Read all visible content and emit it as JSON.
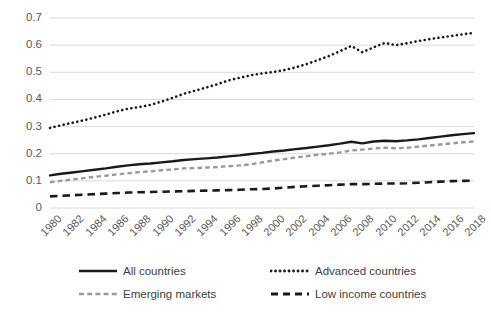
{
  "chart_data": {
    "type": "line",
    "title": "",
    "subtitle": "",
    "xlabel": "",
    "ylabel": "",
    "xlim": [
      1980,
      2018
    ],
    "ylim": [
      0,
      0.7
    ],
    "grid": true,
    "grid_axis": "y",
    "legend_position": "bottom",
    "y_ticks": [
      "0",
      "0.1",
      "0.2",
      "0.3",
      "0.4",
      "0.5",
      "0.6",
      "0.7"
    ],
    "y_tick_values": [
      0,
      0.1,
      0.2,
      0.3,
      0.4,
      0.5,
      0.6,
      0.7
    ],
    "x_tick_labels": [
      "1980",
      "1982",
      "1984",
      "1986",
      "1988",
      "1990",
      "1992",
      "1994",
      "1996",
      "1998",
      "2000",
      "2002",
      "2004",
      "2006",
      "2008",
      "2010",
      "2012",
      "2014",
      "2016",
      "2018"
    ],
    "x": [
      1980,
      1981,
      1982,
      1983,
      1984,
      1985,
      1986,
      1987,
      1988,
      1989,
      1990,
      1991,
      1992,
      1993,
      1994,
      1995,
      1996,
      1997,
      1998,
      1999,
      2000,
      2001,
      2002,
      2003,
      2004,
      2005,
      2006,
      2007,
      2008,
      2009,
      2010,
      2011,
      2012,
      2013,
      2014,
      2015,
      2016,
      2017,
      2018
    ],
    "series": [
      {
        "name": "All countries",
        "style": "solid",
        "color": "#1a1a1a",
        "width": 2.4,
        "values": [
          0.12,
          0.126,
          0.131,
          0.136,
          0.141,
          0.146,
          0.152,
          0.157,
          0.161,
          0.164,
          0.168,
          0.172,
          0.177,
          0.18,
          0.183,
          0.186,
          0.19,
          0.194,
          0.199,
          0.203,
          0.208,
          0.212,
          0.217,
          0.221,
          0.226,
          0.231,
          0.237,
          0.244,
          0.238,
          0.245,
          0.248,
          0.246,
          0.249,
          0.253,
          0.258,
          0.263,
          0.268,
          0.272,
          0.276
        ]
      },
      {
        "name": "Advanced countries",
        "style": "dotted",
        "color": "#1a1a1a",
        "width": 2.6,
        "values": [
          0.295,
          0.305,
          0.314,
          0.323,
          0.333,
          0.344,
          0.356,
          0.366,
          0.372,
          0.38,
          0.392,
          0.406,
          0.421,
          0.432,
          0.444,
          0.456,
          0.47,
          0.48,
          0.489,
          0.496,
          0.501,
          0.508,
          0.518,
          0.53,
          0.545,
          0.56,
          0.578,
          0.597,
          0.574,
          0.592,
          0.608,
          0.6,
          0.607,
          0.615,
          0.622,
          0.628,
          0.634,
          0.64,
          0.645
        ]
      },
      {
        "name": "Emerging markets",
        "style": "dashed",
        "color": "#999999",
        "width": 2.4,
        "values": [
          0.095,
          0.1,
          0.105,
          0.11,
          0.115,
          0.119,
          0.124,
          0.128,
          0.132,
          0.135,
          0.139,
          0.142,
          0.146,
          0.147,
          0.149,
          0.151,
          0.154,
          0.157,
          0.161,
          0.168,
          0.175,
          0.18,
          0.186,
          0.191,
          0.196,
          0.2,
          0.205,
          0.212,
          0.215,
          0.219,
          0.222,
          0.22,
          0.222,
          0.226,
          0.23,
          0.234,
          0.238,
          0.242,
          0.245
        ]
      },
      {
        "name": "Low income countries",
        "style": "dashed-long",
        "color": "#1a1a1a",
        "width": 2.6,
        "values": [
          0.043,
          0.045,
          0.047,
          0.049,
          0.051,
          0.053,
          0.055,
          0.057,
          0.058,
          0.059,
          0.06,
          0.061,
          0.062,
          0.063,
          0.064,
          0.065,
          0.066,
          0.067,
          0.069,
          0.07,
          0.072,
          0.075,
          0.078,
          0.08,
          0.082,
          0.084,
          0.086,
          0.088,
          0.088,
          0.089,
          0.09,
          0.09,
          0.091,
          0.093,
          0.095,
          0.097,
          0.099,
          0.1,
          0.101
        ]
      }
    ],
    "colors": {
      "gridline": "#d9d9d9",
      "axis_text": "#595959",
      "legend_text": "#404040",
      "background": "#ffffff"
    }
  },
  "legend": {
    "items": [
      {
        "label": "All countries"
      },
      {
        "label": "Advanced countries"
      },
      {
        "label": "Emerging markets"
      },
      {
        "label": "Low income countries"
      }
    ]
  }
}
